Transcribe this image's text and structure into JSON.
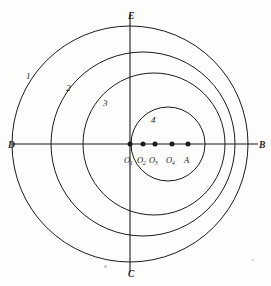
{
  "figure": {
    "background_color": "#fdfdfc",
    "stroke_color": "#1b1b1b",
    "center": {
      "x": 130,
      "y": 144
    },
    "axes": {
      "horizontal": {
        "x1": 12,
        "x2": 258,
        "y": 144
      },
      "vertical": {
        "y1": 14,
        "y2": 272,
        "x": 130
      }
    },
    "cardinals": [
      {
        "name": "E",
        "label": "E",
        "x": 128,
        "y": 12,
        "position": "top"
      },
      {
        "name": "B",
        "label": "B",
        "x": 259,
        "y": 141,
        "position": "right"
      },
      {
        "name": "C",
        "label": "C",
        "x": 128,
        "y": 270,
        "position": "bottom"
      },
      {
        "name": "D",
        "label": "D",
        "x": 8,
        "y": 141,
        "position": "left"
      }
    ],
    "circles": [
      {
        "id": 1,
        "label": "1",
        "center_label": "O1",
        "cx": 130,
        "cy": 144,
        "r": 118,
        "label_x": 26,
        "label_y": 72
      },
      {
        "id": 2,
        "label": "2",
        "center_label": "O2",
        "cx": 143,
        "cy": 144,
        "r": 92,
        "label_x": 66,
        "label_y": 84
      },
      {
        "id": 3,
        "label": "3",
        "center_label": "O3",
        "cx": 154,
        "cy": 144,
        "r": 71,
        "label_x": 103,
        "label_y": 99
      },
      {
        "id": 4,
        "label": "4",
        "center_label": "O4",
        "cx": 168,
        "cy": 144,
        "r": 37,
        "label_x": 151,
        "label_y": 116
      }
    ],
    "points": [
      {
        "name": "O1",
        "label": "O",
        "sub": "1",
        "x": 130,
        "y": 144,
        "label_x": 124,
        "label_y": 156
      },
      {
        "name": "O2",
        "label": "O",
        "sub": "2",
        "x": 143,
        "y": 144,
        "label_x": 137,
        "label_y": 156
      },
      {
        "name": "O3",
        "label": "O",
        "sub": "3",
        "x": 155,
        "y": 144,
        "label_x": 149,
        "label_y": 156
      },
      {
        "name": "O4",
        "label": "O",
        "sub": "4",
        "x": 172,
        "y": 144,
        "label_x": 166,
        "label_y": 156
      },
      {
        "name": "A",
        "label": "A",
        "sub": "",
        "x": 188,
        "y": 144,
        "label_x": 184,
        "label_y": 156
      }
    ],
    "point_radius": 2.5,
    "specks": [
      {
        "x": 104,
        "y": 265,
        "size": 3
      },
      {
        "x": 252,
        "y": 259,
        "size": 2
      }
    ]
  }
}
